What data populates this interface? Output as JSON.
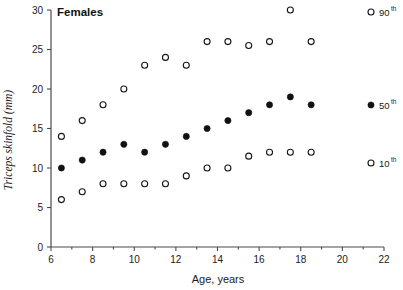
{
  "panel": {
    "title": "Females"
  },
  "axes": {
    "x": {
      "label": "Age,  years",
      "min": 6,
      "max": 22,
      "ticks": [
        6,
        8,
        10,
        12,
        14,
        16,
        18,
        20,
        22
      ],
      "tick_labels": [
        "6",
        "8",
        "10",
        "12",
        "14",
        "16",
        "18",
        "20",
        "22"
      ],
      "minor_ticks": [
        7,
        9,
        11,
        13,
        15,
        17,
        19,
        21
      ]
    },
    "y": {
      "label": "Triceps  skinfold  (mm)",
      "min": 0,
      "max": 30,
      "ticks": [
        0,
        5,
        10,
        15,
        20,
        25,
        30
      ],
      "tick_labels": [
        "0",
        "5",
        "10",
        "15",
        "20",
        "25",
        "30"
      ]
    }
  },
  "legend": {
    "position": "right",
    "entries": [
      {
        "marker": "open-circle",
        "label": "90",
        "sup": "th",
        "name": "legend-90th"
      },
      {
        "marker": "filled-circle",
        "label": "50",
        "sup": "th",
        "name": "legend-50th"
      },
      {
        "marker": "open-circle",
        "label": "10",
        "sup": "th",
        "name": "legend-10th"
      }
    ]
  },
  "chart_data": {
    "type": "scatter",
    "title": "Females",
    "xlabel": "Age,  years",
    "ylabel": "Triceps  skinfold  (mm)",
    "xlim": [
      6,
      22
    ],
    "ylim": [
      0,
      30
    ],
    "grid": false,
    "legend_position": "right",
    "x": [
      6.5,
      7.5,
      8.5,
      9.5,
      10.5,
      11.5,
      12.5,
      13.5,
      14.5,
      15.5,
      16.5,
      17.5,
      18.5
    ],
    "series": [
      {
        "name": "90th",
        "marker": "open-circle",
        "x": [
          6.5,
          7.5,
          8.5,
          9.5,
          10.5,
          11.5,
          12.5,
          13.5,
          14.5,
          15.5,
          16.5,
          17.5,
          18.5
        ],
        "values": [
          14,
          16,
          18,
          20,
          23,
          24,
          23,
          26,
          26,
          25.5,
          26,
          30,
          26
        ]
      },
      {
        "name": "50th",
        "marker": "filled-circle",
        "x": [
          6.5,
          7.5,
          8.5,
          9.5,
          10.5,
          11.5,
          12.5,
          13.5,
          14.5,
          15.5,
          16.5,
          17.5,
          18.5
        ],
        "values": [
          10,
          11,
          12,
          13,
          12,
          13,
          14,
          15,
          16,
          17,
          18,
          19,
          18
        ]
      },
      {
        "name": "10th",
        "marker": "open-circle",
        "x": [
          6.5,
          7.5,
          8.5,
          9.5,
          10.5,
          11.5,
          12.5,
          13.5,
          14.5,
          15.5,
          16.5,
          17.5,
          18.5
        ],
        "values": [
          6,
          7,
          8,
          8,
          8,
          8,
          9,
          10,
          10,
          11.5,
          12,
          12,
          12
        ]
      }
    ]
  },
  "style": {
    "marker_open_stroke": "#151515",
    "marker_filled_fill": "#111111",
    "axis_color": "#4a4a4a",
    "text_color": "#1a1a1a",
    "background": "#ffffff"
  }
}
